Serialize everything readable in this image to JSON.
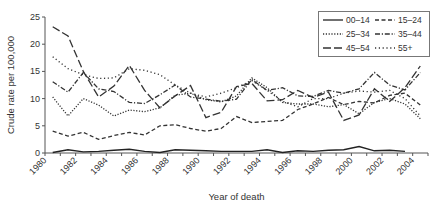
{
  "chart_data": {
    "type": "line",
    "title": "",
    "xlabel": "Year of death",
    "ylabel": "Crude rate per 100,000",
    "ylim": [
      0,
      25
    ],
    "yticks": [
      0,
      5,
      10,
      15,
      20,
      25
    ],
    "xtick_labels": [
      "1980",
      "1982",
      "1984",
      "1986",
      "1988",
      "1990",
      "1992",
      "1994",
      "1996",
      "1998",
      "2000",
      "2002",
      "2004"
    ],
    "x": [
      1980,
      1981,
      1982,
      1983,
      1984,
      1985,
      1986,
      1987,
      1988,
      1989,
      1990,
      1991,
      1992,
      1993,
      1994,
      1995,
      1996,
      1997,
      1998,
      1999,
      2000,
      2001,
      2002,
      2003,
      2004
    ],
    "grid": false,
    "legend_position": "top-right",
    "series": [
      {
        "name": "00–14",
        "style": "solid",
        "values": [
          0.1,
          0.6,
          0.2,
          0.3,
          0.5,
          0.7,
          0.3,
          0.1,
          0.6,
          0.5,
          0.4,
          0.3,
          0.3,
          0.3,
          0.6,
          0.1,
          0.4,
          0.3,
          0.5,
          0.6,
          1.2,
          0.4,
          0.5,
          0.3,
          null
        ]
      },
      {
        "name": "15–24",
        "style": "dashed",
        "values": [
          4.0,
          3.1,
          3.8,
          2.5,
          3.2,
          3.8,
          3.3,
          5.0,
          5.2,
          4.5,
          4.0,
          4.5,
          6.7,
          5.6,
          5.8,
          6.0,
          8.0,
          9.0,
          10.2,
          8.9,
          9.5,
          9.2,
          10.6,
          11.0,
          8.8
        ]
      },
      {
        "name": "25–34",
        "style": "dotted",
        "values": [
          10.3,
          6.8,
          10.0,
          8.8,
          6.8,
          7.9,
          7.6,
          8.3,
          10.6,
          11.0,
          9.8,
          9.4,
          10.5,
          13.8,
          12.0,
          9.3,
          9.0,
          9.0,
          8.5,
          8.9,
          7.2,
          9.3,
          10.0,
          9.0,
          6.3
        ]
      },
      {
        "name": "35–44",
        "style": "dash-dot",
        "values": [
          13.1,
          11.2,
          14.8,
          11.8,
          11.3,
          9.3,
          9.1,
          10.7,
          12.5,
          10.3,
          9.9,
          9.5,
          9.9,
          13.5,
          11.5,
          12.0,
          10.5,
          10.4,
          11.5,
          11.0,
          11.8,
          14.8,
          12.5,
          11.6,
          14.8
        ]
      },
      {
        "name": "45–54",
        "style": "long-dash",
        "values": [
          23.2,
          21.5,
          15.0,
          10.3,
          12.3,
          16.1,
          11.5,
          8.3,
          10.5,
          12.4,
          6.5,
          7.5,
          12.2,
          12.8,
          9.6,
          9.8,
          11.5,
          10.2,
          11.2,
          6.0,
          7.0,
          11.8,
          9.5,
          12.0,
          16.0
        ]
      },
      {
        "name": "55+",
        "style": "sparse-dot",
        "values": [
          17.7,
          15.5,
          14.4,
          13.7,
          13.8,
          15.5,
          15.2,
          14.4,
          12.5,
          11.0,
          10.3,
          11.0,
          12.0,
          13.3,
          11.5,
          9.5,
          8.5,
          10.0,
          10.0,
          11.0,
          11.4,
          11.2,
          11.5,
          10.0,
          6.8
        ]
      }
    ]
  }
}
